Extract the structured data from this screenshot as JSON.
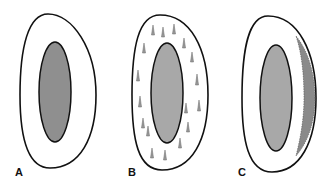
{
  "panels": [
    {
      "label": "A",
      "inner_fill": "#8f8f8f",
      "feature": "none"
    },
    {
      "label": "B",
      "inner_fill": "#a8a8a8",
      "feature": "scattered vertical droplets in outer ring"
    },
    {
      "label": "C",
      "inner_fill": "#a8a8a8",
      "feature": "beaded cluster layer along right outer edge"
    }
  ],
  "colors": {
    "outline": "#111111",
    "background": "#ffffff",
    "droplet": "#9a9a9a",
    "beads": "#8a8a8a"
  }
}
